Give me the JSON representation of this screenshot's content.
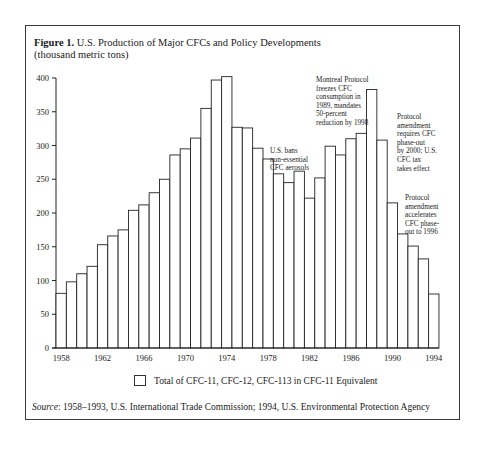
{
  "figure": {
    "label": "Figure 1.",
    "title": "U.S. Production of Major CFCs and Policy Developments",
    "subtitle": "(thousand metric tons)"
  },
  "legend": {
    "label": "Total of CFC-11, CFC-12, CFC-113 in CFC-11 Equivalent"
  },
  "source": {
    "prefix": "Source",
    "text": ": 1958–1993, U.S. International Trade Commission; 1994, U.S. Environmental Protection Agency"
  },
  "annotations": {
    "aerosol_ban": [
      "U.S. bans",
      "non-essential",
      "CFC aerosols"
    ],
    "montreal": [
      "Montreal Protocol",
      "freezes CFC",
      "consumption in",
      "1989, mandates",
      "50-percent",
      "reduction by 1998"
    ],
    "amendment_2000": [
      "Protocol",
      "amendment",
      "requires CFC",
      "phase-out",
      "by 2000; U.S.",
      "CFC tax",
      "takes effect"
    ],
    "amendment_1996": [
      "Protocol",
      "amendment",
      "accelerates",
      "CFC phase-",
      "out to 1996"
    ]
  },
  "chart_data": {
    "type": "bar",
    "title": "U.S. Production of Major CFCs and Policy Developments",
    "subtitle": "(thousand metric tons)",
    "xlabel": "",
    "ylabel": "thousand metric tons",
    "ylim": [
      0,
      400
    ],
    "yticks": [
      0,
      50,
      100,
      150,
      200,
      250,
      300,
      350,
      400
    ],
    "xticks": [
      "1958",
      "1962",
      "1966",
      "1970",
      "1974",
      "1978",
      "1982",
      "1986",
      "1990",
      "1994"
    ],
    "grid": false,
    "legend_position": "bottom",
    "categories": [
      "1958",
      "1959",
      "1960",
      "1961",
      "1962",
      "1963",
      "1964",
      "1965",
      "1966",
      "1967",
      "1968",
      "1969",
      "1970",
      "1971",
      "1972",
      "1973",
      "1974",
      "1975",
      "1976",
      "1977",
      "1978",
      "1979",
      "1980",
      "1981",
      "1982",
      "1983",
      "1984",
      "1985",
      "1986",
      "1987",
      "1988",
      "1989",
      "1990",
      "1991",
      "1992",
      "1993",
      "1994"
    ],
    "series": [
      {
        "name": "Total of CFC-11, CFC-12, CFC-113 in CFC-11 Equivalent",
        "values": [
          81,
          98,
          110,
          121,
          153,
          166,
          175,
          204,
          212,
          230,
          250,
          286,
          295,
          311,
          355,
          397,
          402,
          327,
          326,
          296,
          280,
          258,
          245,
          262,
          222,
          252,
          299,
          286,
          310,
          318,
          383,
          308,
          215,
          169,
          151,
          132,
          80
        ]
      }
    ],
    "annotations": [
      {
        "x": "1979",
        "text": "U.S. bans non-essential CFC aerosols"
      },
      {
        "x": "1987",
        "text": "Montreal Protocol freezes CFC consumption in 1989, mandates 50-percent reduction by 1998"
      },
      {
        "x": "1990",
        "text": "Protocol amendment requires CFC phase-out by 2000; U.S. CFC tax takes effect"
      },
      {
        "x": "1992",
        "text": "Protocol amendment accelerates CFC phase-out to 1996"
      }
    ]
  }
}
